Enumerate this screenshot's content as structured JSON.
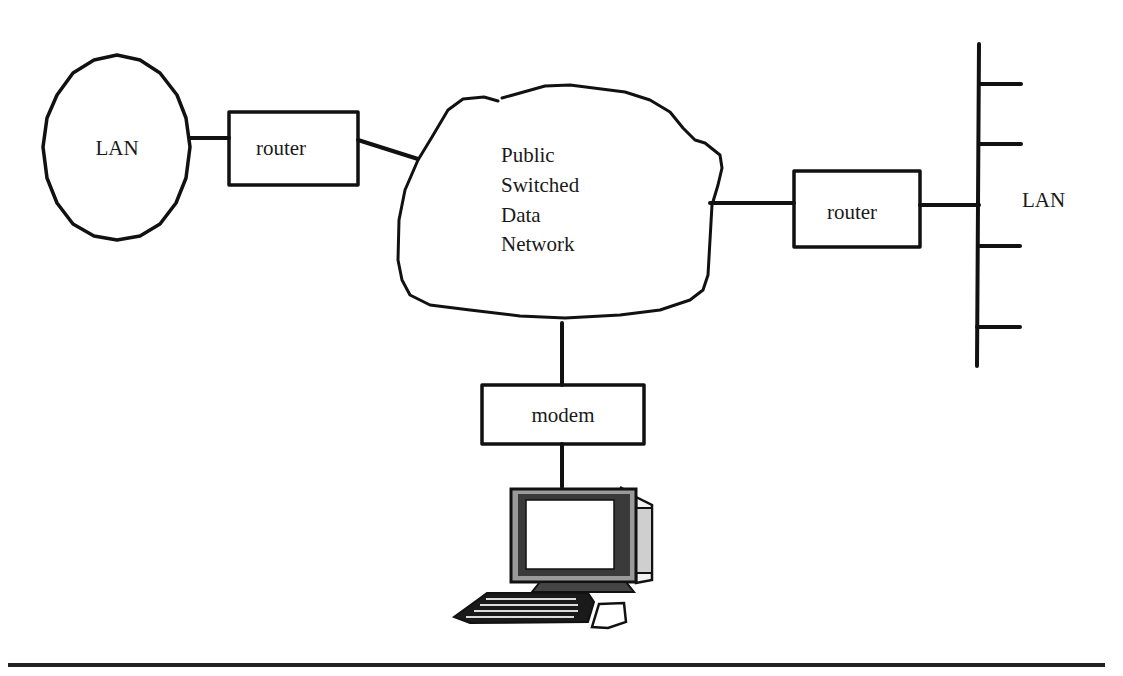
{
  "diagram": {
    "type": "network-topology",
    "nodes": {
      "left_lan": {
        "label": "LAN",
        "shape": "ellipse"
      },
      "left_router": {
        "label": "router",
        "shape": "box"
      },
      "cloud": {
        "label_lines": [
          "Public",
          "Switched",
          "Data",
          "Network"
        ],
        "shape": "cloud"
      },
      "right_router": {
        "label": "router",
        "shape": "box"
      },
      "right_lan": {
        "label": "LAN",
        "shape": "bus",
        "taps": 4
      },
      "modem": {
        "label": "modem",
        "shape": "box"
      },
      "computer": {
        "icon": "desktop-computer-icon"
      }
    },
    "edges": [
      {
        "from": "left_lan",
        "to": "left_router"
      },
      {
        "from": "left_router",
        "to": "cloud"
      },
      {
        "from": "cloud",
        "to": "right_router"
      },
      {
        "from": "right_router",
        "to": "right_lan"
      },
      {
        "from": "cloud",
        "to": "modem"
      },
      {
        "from": "modem",
        "to": "computer"
      }
    ],
    "colors": {
      "line": "#111111",
      "background": "#ffffff",
      "monitor_bezel": "#9a9a9a"
    }
  }
}
